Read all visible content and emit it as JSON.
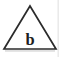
{
  "figure": {
    "name": "triangle-label-b",
    "background_color": "#ffffff",
    "shape": {
      "type": "triangle",
      "outline_color": "#2b2b2b",
      "fill_color": "#ffffff",
      "stroke_width": 1.7,
      "apex": {
        "x": 30,
        "y": 6
      },
      "base_left": {
        "x": 4,
        "y": 49
      },
      "base_right": {
        "x": 56,
        "y": 49
      }
    },
    "label": {
      "text": "b",
      "color": "#1f1f1f",
      "center_x": 30,
      "baseline_y": 45,
      "font_size_px": 16.5,
      "font_weight": "bold",
      "style": "serif"
    },
    "artifacts": {
      "base_shadow_color": "#b9b9b9",
      "right_edge_color": "#d8d8d8"
    }
  }
}
